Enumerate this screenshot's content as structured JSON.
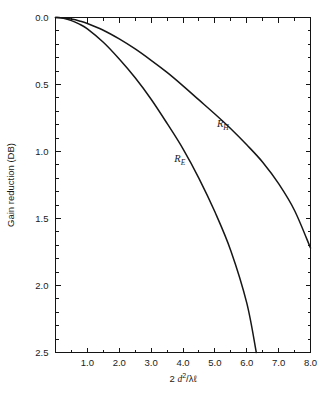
{
  "figure": {
    "background_color": "#ffffff",
    "axis_color": "#141414",
    "curve_color": "#161616"
  },
  "chart_data": {
    "type": "line",
    "title": "",
    "subtitle": "",
    "xlabel": "2 d2/λℓ",
    "xlabel_parts": {
      "lead": "2 ",
      "var": "d",
      "exponent": "2",
      "denominator": "/λℓ"
    },
    "ylabel": "Gain reduction (DB)",
    "xlim": [
      0,
      8.0
    ],
    "ylim": [
      0,
      2.5
    ],
    "y_inverted": true,
    "grid": false,
    "legend": "inline-labels",
    "x_ticks_major": [
      1.0,
      2.0,
      3.0,
      4.0,
      5.0,
      6.0,
      7.0,
      8.0
    ],
    "x_ticklabels": [
      "1.0",
      "2.0",
      "3.0",
      "4.0",
      "5.0",
      "6.0",
      "7.0",
      "8.0"
    ],
    "x_tick_minor_step": 0.5,
    "y_ticks_major": [
      0.0,
      0.5,
      1.0,
      1.5,
      2.0,
      2.5
    ],
    "y_ticklabels": [
      "0.0",
      "0.5",
      "1.0",
      "1.5",
      "2.0",
      "2.5"
    ],
    "y_tick_minor_step": 0.1,
    "series": [
      {
        "name": "R_H",
        "label_text": "R",
        "label_sub": "H",
        "label_at": {
          "x": 5.25,
          "y": 0.82
        },
        "x": [
          0.0,
          0.25,
          0.5,
          0.75,
          1.0,
          1.5,
          2.0,
          2.5,
          3.0,
          3.5,
          4.0,
          4.5,
          5.0,
          5.5,
          6.0,
          6.5,
          7.0,
          7.5,
          8.0
        ],
        "values": [
          0.0,
          0.003,
          0.012,
          0.026,
          0.045,
          0.095,
          0.16,
          0.235,
          0.32,
          0.41,
          0.51,
          0.615,
          0.72,
          0.83,
          0.95,
          1.08,
          1.24,
          1.44,
          1.72
        ]
      },
      {
        "name": "R_E",
        "label_text": "R",
        "label_sub": "E",
        "label_at": {
          "x": 3.9,
          "y": 1.08
        },
        "x": [
          0.0,
          0.25,
          0.5,
          0.75,
          1.0,
          1.5,
          2.0,
          2.5,
          3.0,
          3.5,
          4.0,
          4.5,
          5.0,
          5.5,
          6.0,
          6.3
        ],
        "values": [
          0.0,
          0.006,
          0.023,
          0.05,
          0.085,
          0.185,
          0.31,
          0.45,
          0.61,
          0.79,
          0.98,
          1.2,
          1.45,
          1.74,
          2.13,
          2.5
        ]
      }
    ]
  }
}
